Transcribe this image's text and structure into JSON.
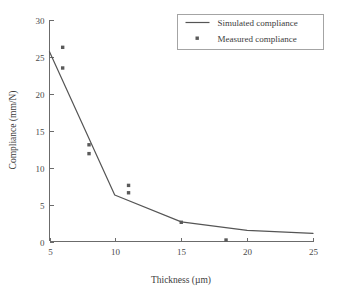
{
  "chart_data": {
    "type": "line",
    "title": "",
    "xlabel": "Thickness (µm)",
    "ylabel": "Compliance (mm/N)",
    "xlim": [
      5,
      25
    ],
    "ylim": [
      0,
      30
    ],
    "xticks": [
      5,
      10,
      15,
      20,
      25
    ],
    "yticks": [
      0,
      5,
      10,
      15,
      20,
      25,
      30
    ],
    "xtick_labels": [
      "5",
      "10",
      "15",
      "20",
      "25"
    ],
    "ytick_labels": [
      "0",
      "5",
      "10",
      "15",
      "20",
      "25",
      "30"
    ],
    "grid": false,
    "legend_position": "top-right",
    "series": [
      {
        "name": "Simulated compliance",
        "type": "line",
        "color": "#555555",
        "points": [
          {
            "x": 5.0,
            "y": 25.7
          },
          {
            "x": 9.95,
            "y": 6.3
          },
          {
            "x": 15.0,
            "y": 2.65
          },
          {
            "x": 20.0,
            "y": 1.5
          },
          {
            "x": 25.0,
            "y": 1.1
          }
        ]
      },
      {
        "name": "Measured compliance",
        "type": "scatter",
        "color": "#5a5a5a",
        "marker": "square",
        "points": [
          {
            "x": 6.0,
            "y": 26.3
          },
          {
            "x": 6.0,
            "y": 23.5
          },
          {
            "x": 8.0,
            "y": 13.1
          },
          {
            "x": 8.0,
            "y": 11.9
          },
          {
            "x": 11.0,
            "y": 7.6
          },
          {
            "x": 11.0,
            "y": 6.6
          },
          {
            "x": 15.0,
            "y": 2.6
          },
          {
            "x": 18.4,
            "y": 0.2
          }
        ]
      }
    ],
    "legend": [
      {
        "label": "Simulated compliance",
        "swatch": "line"
      },
      {
        "label": "Measured compliance",
        "swatch": "square-marker"
      }
    ]
  }
}
